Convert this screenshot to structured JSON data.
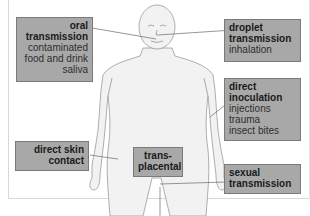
{
  "diagram": {
    "colors": {
      "box_fill": "#a8a8a8",
      "box_border": "#7a7a7a",
      "body_fill": "#f0f0f0",
      "body_stroke": "#9a9a9a",
      "leader_line": "#6a6a6a"
    },
    "labels": {
      "oral": {
        "title_line1": "oral",
        "title_line2": "transmission",
        "items": [
          "contaminated",
          "food and drink",
          "saliva"
        ]
      },
      "droplet": {
        "title_line1": "droplet",
        "title_line2": "transmission",
        "items": [
          "inhalation"
        ]
      },
      "inoculation": {
        "title_line1": "direct",
        "title_line2": "inoculation",
        "items": [
          "injections",
          "trauma",
          "insect bites"
        ]
      },
      "skin": {
        "title_line1": "direct skin",
        "title_line2": "contact"
      },
      "placental": {
        "title_line1": "trans-",
        "title_line2": "placental"
      },
      "sexual": {
        "title_line1": "sexual",
        "title_line2": "transmission"
      }
    }
  }
}
